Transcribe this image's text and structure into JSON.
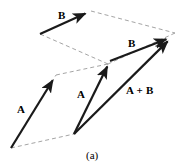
{
  "figure": {
    "caption": "(a)",
    "caption_x": 86,
    "caption_y": 150,
    "width": 181,
    "height": 167,
    "background_color": "#ffffff",
    "solid_color": "#1a1a1a",
    "dashed_color": "#9a9a9a",
    "solid_width": 2.2,
    "dashed_width": 0.9,
    "dash_pattern": "4,3"
  },
  "labels": [
    {
      "id": "b-top",
      "text": "B",
      "x": 58,
      "y": 10,
      "name": "vector-label-b-top"
    },
    {
      "id": "b-right",
      "text": "B",
      "x": 128,
      "y": 38,
      "name": "vector-label-b-right"
    },
    {
      "id": "a-left",
      "text": "A",
      "x": 17,
      "y": 104,
      "name": "vector-label-a-left"
    },
    {
      "id": "a-mid",
      "text": "A",
      "x": 77,
      "y": 89,
      "name": "vector-label-a-middle"
    },
    {
      "id": "a-plus-b",
      "text": "A + B",
      "x": 126,
      "y": 85,
      "name": "vector-label-a-plus-b"
    }
  ],
  "chart_data": {
    "type": "diagram",
    "subtitle": "(a)",
    "coordinate_space": {
      "width": 181,
      "height": 167,
      "origin": "top-left",
      "y_axis": "down"
    },
    "points": {
      "O_left": {
        "x": 11,
        "y": 148,
        "desc": "tail of left A vector (lower-left parallelogram origin)"
      },
      "A_left_tip": {
        "x": 56,
        "y": 75,
        "desc": "head of left A vector"
      },
      "B_top_tail": {
        "x": 40,
        "y": 34,
        "desc": "tail of upper B vector"
      },
      "B_top_tip": {
        "x": 91,
        "y": 11,
        "desc": "head of upper B vector"
      },
      "O_right": {
        "x": 74,
        "y": 134,
        "desc": "common tail of right-hand A and A+B vectors"
      },
      "A_mid_tip": {
        "x": 110,
        "y": 61,
        "desc": "head of middle A vector"
      },
      "B_right_tip": {
        "x": 172,
        "y": 37,
        "desc": "head of right B vector and of resultant A+B"
      },
      "dash_mid": {
        "x": 108,
        "y": 64,
        "desc": "interior vertex where the two dashed parallelograms meet"
      },
      "dash_upper_right": {
        "x": 175,
        "y": 33,
        "desc": "upper-right dashed vertex"
      },
      "dash_upper_left": {
        "x": 40,
        "y": 34,
        "desc": "upper-left dashed vertex"
      }
    },
    "solid_vectors": [
      {
        "name": "B-top",
        "label": "B",
        "from": "B_top_tail",
        "to": "B_top_tip",
        "arrowhead": true
      },
      {
        "name": "A-left",
        "label": "A",
        "from": "O_left",
        "to": "A_left_tip",
        "arrowhead": true
      },
      {
        "name": "A-middle",
        "label": "A",
        "from": "O_right",
        "to": "A_mid_tip",
        "arrowhead": true
      },
      {
        "name": "B-right",
        "label": "B",
        "from": "A_mid_tip",
        "to": "B_right_tip",
        "arrowhead": true
      },
      {
        "name": "A-plus-B",
        "label": "A + B",
        "from": "O_right",
        "to": "B_right_tip",
        "arrowhead": true
      }
    ],
    "dashed_construction_lines": [
      {
        "name": "upper-parallelogram-top",
        "from": "B_top_tip",
        "to": "dash_upper_right"
      },
      {
        "name": "upper-parallelogram-right",
        "from": "dash_upper_right",
        "to": "dash_mid"
      },
      {
        "name": "upper-parallelogram-bottom",
        "from": "dash_mid",
        "to": "B_top_tail"
      },
      {
        "name": "lower-parallelogram-top",
        "from": "A_left_tip",
        "to": "dash_mid"
      },
      {
        "name": "lower-parallelogram-left",
        "from": "O_left",
        "to": "A_left_tip"
      },
      {
        "name": "lower-parallelogram-bottom",
        "from": "O_left",
        "to": "O_right"
      },
      {
        "name": "lower-parallelogram-right",
        "from": "O_right",
        "to": "dash_mid"
      }
    ],
    "annotations": [
      "Upper construction: vector B translated so its tail sits at the head of A",
      "Lower construction: A and B drawn from a common origin, resultant A + B is the diagonal"
    ]
  }
}
